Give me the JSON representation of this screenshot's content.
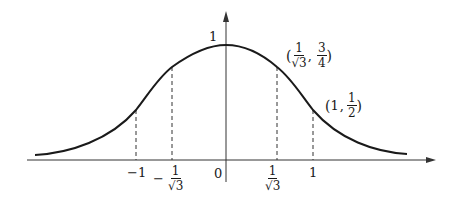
{
  "diagram": {
    "title": "",
    "axes": {
      "y_tick_label": "1",
      "origin_label": "0"
    },
    "x_ticks": [
      {
        "id": "neg1",
        "label": "−1"
      },
      {
        "id": "neg_inv_sqrt3",
        "sign": "−",
        "num": "1",
        "den": "√3"
      },
      {
        "id": "inv_sqrt3",
        "num": "1",
        "den": "√3"
      },
      {
        "id": "pos1",
        "label": "1"
      }
    ],
    "points": [
      {
        "id": "p_inv_sqrt3",
        "open": "(",
        "x_num": "1",
        "x_den": "√3",
        "sep": ",",
        "y_num": "3",
        "y_den": "4",
        "close": ")"
      },
      {
        "id": "p_one",
        "open": "(",
        "x": "1",
        "sep": ",",
        "y_num": "1",
        "y_den": "2",
        "close": ")"
      }
    ]
  }
}
